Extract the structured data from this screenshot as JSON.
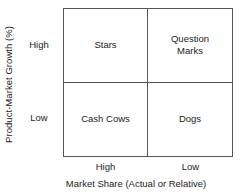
{
  "chart_data": {
    "type": "table",
    "title": "",
    "xlabel": "Market Share (Actual or Relative)",
    "ylabel": "Product-Market Growth (%)",
    "x_categories": [
      "High",
      "Low"
    ],
    "y_categories": [
      "High",
      "Low"
    ],
    "grid": true,
    "legend": "none",
    "cells": [
      {
        "row": "High",
        "col": "High",
        "label": "Stars"
      },
      {
        "row": "High",
        "col": "Low",
        "label": "Question\nMarks"
      },
      {
        "row": "Low",
        "col": "High",
        "label": "Cash Cows"
      },
      {
        "row": "Low",
        "col": "Low",
        "label": "Dogs"
      }
    ]
  },
  "matrix": {
    "quadrants": {
      "top_left": "Stars",
      "top_right_line1": "Question",
      "top_right_line2": "Marks",
      "bottom_left": "Cash Cows",
      "bottom_right": "Dogs"
    }
  },
  "axes": {
    "y": {
      "title": "Product-Market Growth (%)",
      "tick_high": "High",
      "tick_low": "Low"
    },
    "x": {
      "title": "Market Share (Actual or Relative)",
      "tick_high": "High",
      "tick_low": "Low"
    }
  },
  "colors": {
    "background": "#ffffff",
    "line": "#555555",
    "text": "#1c1c1c"
  }
}
